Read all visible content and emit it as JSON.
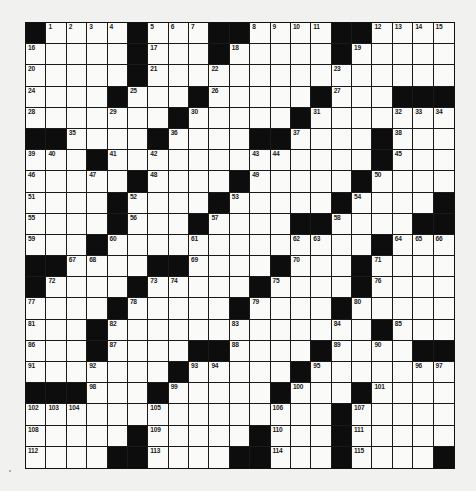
{
  "puzzle": {
    "type": "crossword",
    "rows": 21,
    "cols": 21,
    "colors": {
      "background": "#f1f1ef",
      "cell": "#fafaf8",
      "block": "#0d0d0d",
      "line": "#1a1a1a"
    },
    "grid": [
      [
        "#",
        1,
        2,
        3,
        4,
        "#",
        5,
        6,
        7,
        "#",
        "#",
        8,
        9,
        10,
        11,
        "#",
        "#",
        12,
        13,
        14,
        15
      ],
      [
        16,
        "",
        "",
        "",
        "",
        "#",
        17,
        "",
        "",
        "#",
        18,
        "",
        "",
        "",
        "",
        "#",
        19,
        "",
        "",
        "",
        ""
      ],
      [
        20,
        "",
        "",
        "",
        "",
        "#",
        21,
        "",
        "",
        22,
        "",
        "",
        "",
        "",
        "",
        23,
        "",
        "",
        "",
        "",
        ""
      ],
      [
        24,
        "",
        "",
        "",
        "#",
        25,
        "",
        "",
        "#",
        26,
        "",
        "",
        "",
        "",
        "#",
        27,
        "",
        "",
        "#",
        "#",
        "#"
      ],
      [
        28,
        "",
        "",
        "",
        29,
        "",
        "",
        "#",
        30,
        "",
        "",
        "",
        "",
        "#",
        31,
        "",
        "",
        "",
        32,
        33,
        34
      ],
      [
        "#",
        "#",
        35,
        "",
        "",
        "",
        "#",
        36,
        "",
        "",
        "",
        "#",
        "#",
        37,
        "",
        "",
        "",
        "#",
        38,
        "",
        ""
      ],
      [
        39,
        40,
        "",
        "#",
        41,
        "",
        42,
        "",
        "",
        "",
        "",
        43,
        44,
        "",
        "",
        "",
        "",
        "#",
        45,
        "",
        ""
      ],
      [
        46,
        "",
        "",
        47,
        "",
        "#",
        48,
        "",
        "",
        "",
        "#",
        49,
        "",
        "",
        "",
        "",
        "#",
        50,
        "",
        "",
        ""
      ],
      [
        51,
        "",
        "",
        "",
        "#",
        52,
        "",
        "",
        "",
        "#",
        53,
        "",
        "",
        "",
        "",
        "#",
        54,
        "",
        "",
        "",
        "#"
      ],
      [
        55,
        "",
        "",
        "",
        "#",
        56,
        "",
        "",
        "#",
        57,
        "",
        "",
        "",
        "#",
        "#",
        58,
        "",
        "",
        "",
        "#",
        "#"
      ],
      [
        59,
        "",
        "",
        "#",
        60,
        "",
        "",
        "",
        61,
        "",
        "",
        "",
        "",
        62,
        63,
        "",
        "",
        "#",
        64,
        65,
        66
      ],
      [
        "#",
        "#",
        67,
        68,
        "",
        "",
        "#",
        "#",
        69,
        "",
        "",
        "",
        "#",
        70,
        "",
        "",
        "#",
        71,
        "",
        "",
        ""
      ],
      [
        "#",
        72,
        "",
        "",
        "",
        "#",
        73,
        74,
        "",
        "",
        "",
        "#",
        75,
        "",
        "",
        "",
        "#",
        76,
        "",
        "",
        ""
      ],
      [
        77,
        "",
        "",
        "",
        "#",
        78,
        "",
        "",
        "",
        "",
        "#",
        79,
        "",
        "",
        "",
        "#",
        80,
        "",
        "",
        "",
        ""
      ],
      [
        81,
        "",
        "",
        "#",
        82,
        "",
        "",
        "",
        "",
        "",
        83,
        "",
        "",
        "",
        "",
        84,
        "",
        "#",
        85,
        "",
        ""
      ],
      [
        86,
        "",
        "",
        "#",
        87,
        "",
        "",
        "",
        "#",
        "#",
        88,
        "",
        "",
        "",
        "#",
        89,
        "",
        90,
        "",
        "#",
        "#"
      ],
      [
        91,
        "",
        "",
        92,
        "",
        "",
        "",
        "#",
        93,
        94,
        "",
        "",
        "",
        "#",
        95,
        "",
        "",
        "",
        "",
        96,
        97
      ],
      [
        "#",
        "#",
        "#",
        98,
        "",
        "",
        "#",
        99,
        "",
        "",
        "",
        "",
        "#",
        100,
        "",
        "",
        "#",
        101,
        "",
        "",
        ""
      ],
      [
        102,
        103,
        104,
        "",
        "",
        "",
        105,
        "",
        "",
        "",
        "",
        "",
        106,
        "",
        "",
        "#",
        107,
        "",
        "",
        "",
        ""
      ],
      [
        108,
        "",
        "",
        "",
        "",
        "#",
        109,
        "",
        "",
        "",
        "",
        "#",
        110,
        "",
        "",
        "#",
        111,
        "",
        "",
        "",
        ""
      ],
      [
        112,
        "",
        "",
        "",
        "#",
        "#",
        113,
        "",
        "",
        "",
        "#",
        "#",
        114,
        "",
        "",
        "#",
        115,
        "",
        "",
        "",
        "#"
      ]
    ]
  }
}
